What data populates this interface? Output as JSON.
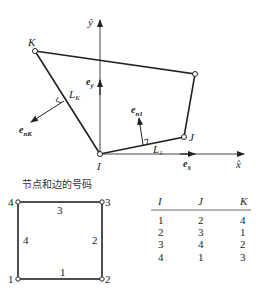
{
  "quad_diagram": {
    "axes": {
      "x_label": "x̂",
      "y_label": "ŷ"
    },
    "nodes": {
      "I": "I",
      "J": "J",
      "K": "K"
    },
    "unit_vectors": {
      "ex_base": "e",
      "ex_sub": "x̂",
      "ey_base": "e",
      "ey_sub": "ŷ"
    },
    "edges": {
      "L1_base": "L",
      "L1_sub": "1",
      "LK_base": "L",
      "LK_sub": "K"
    },
    "normals": {
      "n1_base": "e",
      "n1_sub": "n1",
      "nK_base": "e",
      "nK_sub": "nK"
    }
  },
  "numbering": {
    "title": "节点和边的号码",
    "node_labels": [
      "1",
      "2",
      "3",
      "4"
    ],
    "edge_labels": [
      "1",
      "2",
      "3",
      "4"
    ]
  },
  "table": {
    "headers": [
      "I",
      "J",
      "K"
    ],
    "rows": [
      [
        "1",
        "2",
        "4"
      ],
      [
        "2",
        "3",
        "1"
      ],
      [
        "3",
        "4",
        "2"
      ],
      [
        "4",
        "1",
        "3"
      ]
    ]
  }
}
